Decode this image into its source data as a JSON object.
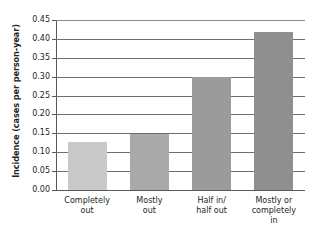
{
  "top_crop_text": "·  ·    ·  ·        ·        ·   ·",
  "chart_data": {
    "type": "bar",
    "title": "",
    "subtitle": "",
    "xlabel": "",
    "ylabel": "Incidence (cases per person-year)",
    "categories": [
      "Completely\nout",
      "Mostly\nout",
      "Half in/\nhalf out",
      "Mostly or\ncompletely\nin"
    ],
    "values": [
      0.128,
      0.148,
      0.3,
      0.417
    ],
    "ylim": [
      0.0,
      0.45
    ],
    "ytick_labels": [
      "0.45",
      "0.40",
      "0.35",
      "0.30",
      "0.25",
      "0.20",
      "0.15",
      "0.10",
      "0.05",
      "0.00"
    ],
    "ytick_values": [
      0.45,
      0.4,
      0.35,
      0.3,
      0.25,
      0.2,
      0.15,
      0.1,
      0.05,
      0.0
    ],
    "ytick_step": 0.05,
    "grid": true,
    "legend": "none",
    "bar_colors": [
      "#c9c9c9",
      "#a9a9a9",
      "#9b9b9b",
      "#8f8f8f"
    ],
    "axis_color": "#58595b",
    "grid_color": "#6d6e71",
    "text_color": "#231f20"
  }
}
